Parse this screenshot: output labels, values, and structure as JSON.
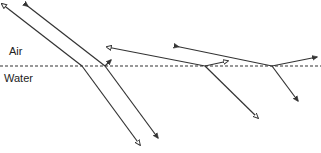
{
  "diagram": {
    "labels": {
      "upper_medium": "Air",
      "lower_medium": "Water"
    },
    "interface": {
      "y": 66,
      "x1": 0,
      "x2": 321,
      "style": "dashed"
    },
    "colors": {
      "line": "#333333",
      "background": "#ffffff"
    },
    "rays": [
      {
        "id": "ray-1",
        "marker": "open-arrow",
        "incident": [
          [
            2,
            4
          ],
          [
            82,
            66
          ]
        ],
        "refracted": [
          [
            82,
            66
          ],
          [
            140,
            145
          ]
        ],
        "reflected": null
      },
      {
        "id": "ray-2",
        "marker": "filled-arrow",
        "incident": [
          [
            25,
            4
          ],
          [
            105,
            66
          ]
        ],
        "refracted": [
          [
            105,
            66
          ],
          [
            158,
            138
          ]
        ],
        "reflected": [
          [
            105,
            66
          ],
          [
            111,
            60
          ]
        ]
      },
      {
        "id": "ray-3",
        "marker": "open-arrow",
        "incident": [
          [
            107,
            47
          ],
          [
            205,
            66
          ]
        ],
        "refracted": [
          [
            205,
            66
          ],
          [
            258,
            118
          ]
        ],
        "reflected": [
          [
            205,
            66
          ],
          [
            228,
            61
          ]
        ]
      },
      {
        "id": "ray-4",
        "marker": "filled-arrow",
        "incident": [
          [
            175,
            46
          ],
          [
            272,
            66
          ]
        ],
        "refracted": [
          [
            272,
            66
          ],
          [
            298,
            101
          ]
        ],
        "reflected": [
          [
            272,
            66
          ],
          [
            317,
            57
          ]
        ]
      }
    ]
  }
}
